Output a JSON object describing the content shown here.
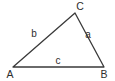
{
  "figure": {
    "type": "triangle-diagram",
    "background_color": "#ffffff",
    "stroke_color": "#3a3a3a",
    "text_color": "#2e2e2e",
    "width": 115,
    "height": 81
  },
  "vertices": [
    {
      "label": "A",
      "point_x": 13,
      "point_y": 67,
      "label_x": 10,
      "label_y": 74
    },
    {
      "label": "B",
      "point_x": 104,
      "point_y": 67,
      "label_x": 104,
      "label_y": 74
    },
    {
      "label": "C",
      "point_x": 75,
      "point_y": 13,
      "label_x": 80,
      "label_y": 6
    }
  ],
  "sides": [
    {
      "label": "a",
      "from": "C",
      "to": "B",
      "label_x": 88,
      "label_y": 35
    },
    {
      "label": "b",
      "from": "A",
      "to": "C",
      "label_x": 34,
      "label_y": 34
    },
    {
      "label": "c",
      "from": "A",
      "to": "B",
      "label_x": 58,
      "label_y": 61
    }
  ],
  "path": "M 13 67 L 75 13 L 104 67 Z"
}
